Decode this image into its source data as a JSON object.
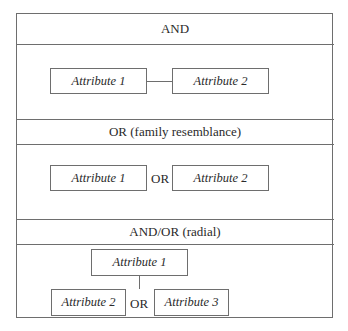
{
  "diagram": {
    "sections": [
      {
        "title": "AND",
        "attributes": [
          "Attribute 1",
          "Attribute 2"
        ],
        "connector": "line"
      },
      {
        "title": "OR (family resemblance)",
        "attributes": [
          "Attribute 1",
          "Attribute 2"
        ],
        "connector_label": "OR"
      },
      {
        "title": "AND/OR (radial)",
        "attributes": [
          "Attribute 1",
          "Attribute 2",
          "Attribute 3"
        ],
        "connector_label": "OR"
      }
    ]
  },
  "colors": {
    "line": "#6e6e6e",
    "text": "#2a2a2a",
    "background": "#ffffff"
  }
}
